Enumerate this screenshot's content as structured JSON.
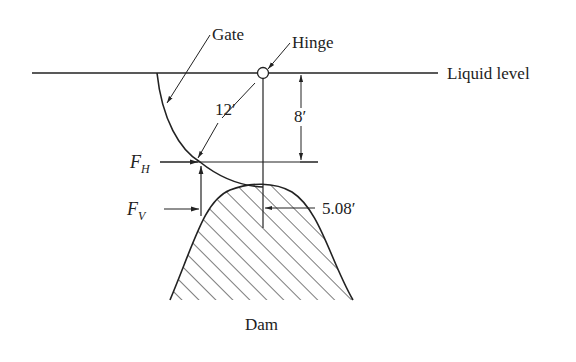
{
  "diagram": {
    "labels": {
      "gate": "Gate",
      "hinge": "Hinge",
      "liquid_level": "Liquid level",
      "radius": "12′",
      "depth": "8′",
      "fh": "F",
      "fh_sub": "H",
      "fv": "F",
      "fv_sub": "V",
      "offset": "5.08′",
      "dam": "Dam"
    },
    "colors": {
      "line": "#222222",
      "background": "#ffffff"
    }
  }
}
